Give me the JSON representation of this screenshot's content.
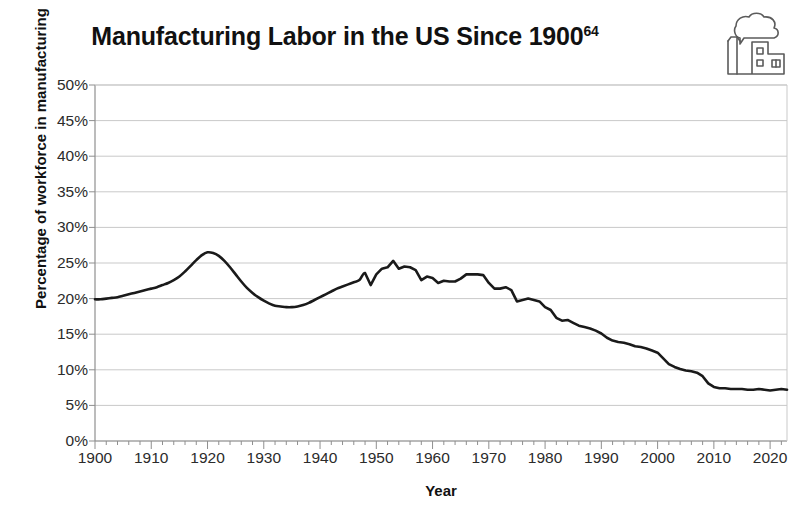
{
  "title": {
    "text": "Manufacturing Labor in the US Since 1900",
    "footnote": "64"
  },
  "icon": {
    "name": "factory-icon",
    "label": "factory-with-smoke-icon"
  },
  "axes": {
    "xlabel": "Year",
    "ylabel": "Percentage of workforce in manufacturing",
    "ytick_labels": [
      "50%",
      "45%",
      "40%",
      "35%",
      "30%",
      "25%",
      "20%",
      "15%",
      "10%",
      "5%",
      "0%"
    ],
    "xtick_labels": [
      "1900",
      "1910",
      "1920",
      "1930",
      "1940",
      "1950",
      "1960",
      "1970",
      "1980",
      "1990",
      "2000",
      "2010",
      "2020"
    ]
  },
  "colors": {
    "line": "#1a1a1a",
    "grid": "#c9c9c9",
    "axis": "#8f8f8f",
    "background": "#ffffff",
    "text": "#1a1a1a"
  },
  "chart_data": {
    "type": "line",
    "title": "Manufacturing Labor in the US Since 1900",
    "xlabel": "Year",
    "ylabel": "Percentage of workforce in manufacturing",
    "xlim": [
      1900,
      2023
    ],
    "ylim": [
      0,
      50
    ],
    "y_unit": "percent",
    "grid": true,
    "legend": "none",
    "x_major_tick_step": 10,
    "x_minor_tick_step": 2,
    "y_tick_step": 5,
    "series": [
      {
        "name": "Percentage of workforce in manufacturing",
        "color": "#1a1a1a",
        "x": [
          1900,
          1901,
          1902,
          1903,
          1904,
          1905,
          1906,
          1907,
          1908,
          1909,
          1910,
          1911,
          1912,
          1913,
          1914,
          1915,
          1916,
          1917,
          1918,
          1919,
          1920,
          1921,
          1922,
          1923,
          1924,
          1925,
          1926,
          1927,
          1928,
          1929,
          1930,
          1931,
          1932,
          1933,
          1934,
          1935,
          1936,
          1937,
          1938,
          1939,
          1940,
          1941,
          1942,
          1943,
          1944,
          1945,
          1946,
          1947,
          1948,
          1949,
          1950,
          1951,
          1952,
          1953,
          1954,
          1955,
          1956,
          1957,
          1958,
          1959,
          1960,
          1961,
          1962,
          1963,
          1964,
          1965,
          1966,
          1967,
          1968,
          1969,
          1970,
          1971,
          1972,
          1973,
          1974,
          1975,
          1976,
          1977,
          1978,
          1979,
          1980,
          1981,
          1982,
          1983,
          1984,
          1985,
          1986,
          1987,
          1988,
          1989,
          1990,
          1991,
          1992,
          1993,
          1994,
          1995,
          1996,
          1997,
          1998,
          1999,
          2000,
          2001,
          2002,
          2003,
          2004,
          2005,
          2006,
          2007,
          2008,
          2009,
          2010,
          2011,
          2012,
          2013,
          2014,
          2015,
          2016,
          2017,
          2018,
          2019,
          2020,
          2021,
          2022,
          2023
        ],
        "y": [
          19.9,
          19.9,
          20.0,
          20.1,
          20.2,
          20.4,
          20.6,
          20.8,
          21.0,
          21.2,
          21.4,
          21.6,
          21.9,
          22.2,
          22.6,
          23.1,
          23.8,
          24.6,
          25.4,
          26.1,
          26.5,
          26.4,
          26.0,
          25.3,
          24.4,
          23.4,
          22.4,
          21.5,
          20.8,
          20.2,
          19.7,
          19.3,
          19.0,
          18.9,
          18.8,
          18.8,
          18.9,
          19.1,
          19.4,
          19.8,
          20.2,
          20.6,
          21.0,
          21.4,
          21.7,
          22.0,
          22.3,
          22.6,
          23.6,
          21.9,
          23.4,
          24.2,
          24.4,
          25.3,
          24.2,
          24.5,
          24.4,
          24.0,
          22.6,
          23.1,
          22.9,
          22.2,
          22.5,
          22.4,
          22.4,
          22.8,
          23.4,
          23.4,
          23.4,
          23.3,
          22.2,
          21.4,
          21.4,
          21.6,
          21.2,
          19.6,
          19.8,
          20.0,
          19.8,
          19.6,
          18.8,
          18.4,
          17.3,
          16.9,
          17.0,
          16.6,
          16.2,
          16.0,
          15.8,
          15.5,
          15.1,
          14.5,
          14.1,
          13.9,
          13.8,
          13.6,
          13.3,
          13.2,
          13.0,
          12.7,
          12.4,
          11.6,
          10.8,
          10.4,
          10.1,
          9.9,
          9.8,
          9.6,
          9.1,
          8.1,
          7.6,
          7.4,
          7.4,
          7.3,
          7.3,
          7.3,
          7.2,
          7.2,
          7.3,
          7.2,
          7.1,
          7.2,
          7.3,
          7.2
        ]
      }
    ],
    "annotations": [
      {
        "label": "peak",
        "x": 1920,
        "y": 26.5
      },
      {
        "label": "depression-trough",
        "x": 1934,
        "y": 18.8
      },
      {
        "label": "postwar-peak",
        "x": 1953,
        "y": 25.3
      },
      {
        "label": "modern-level",
        "x": 2023,
        "y": 7.2
      }
    ]
  }
}
